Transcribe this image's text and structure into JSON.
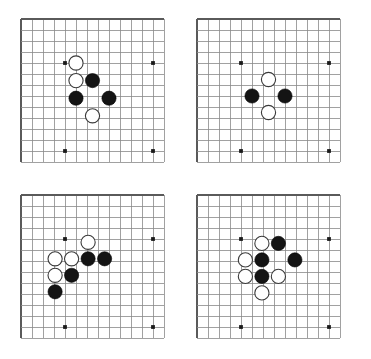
{
  "figure": {
    "type": "go-board-diagram-set",
    "layout": "2x2",
    "panel_count": 4,
    "canvas": {
      "width": 371,
      "height": 359
    }
  },
  "board_geometry": {
    "cell_size": 11,
    "cols": 13,
    "rows": 13,
    "grid_origin_x": 21,
    "grid_origin_y": 19,
    "panel_offset_x": 176,
    "panel_offset_y": 176,
    "stone_radius": 7.1,
    "star_point_radius": 1.9,
    "star_points": [
      [
        4,
        4
      ],
      [
        12,
        4
      ],
      [
        4,
        12
      ],
      [
        12,
        12
      ]
    ],
    "edges": {
      "left": true,
      "top": true,
      "right": false,
      "bottom": false
    }
  },
  "colors": {
    "grid_line": "#8a8a8a",
    "edge_line": "#5a5a5a",
    "black_stone": "#141414",
    "white_stone": "#ffffff",
    "white_stone_outline": "#3a3a3a",
    "star_point": "#1a1a1a",
    "background": "#ffffff"
  },
  "panels": [
    {
      "id": "panel-top-left",
      "position": {
        "x": 0,
        "y": 0
      },
      "stone_count": 5,
      "black_count": 3,
      "white_count": 2,
      "stones": [
        {
          "color": "white",
          "col": 5,
          "row": 4
        },
        {
          "color": "white",
          "col": 5,
          "row": 5.6
        },
        {
          "color": "black",
          "col": 6.5,
          "row": 5.6
        },
        {
          "color": "black",
          "col": 5,
          "row": 7.2
        },
        {
          "color": "black",
          "col": 8,
          "row": 7.2
        },
        {
          "color": "white",
          "col": 6.5,
          "row": 8.8
        }
      ]
    },
    {
      "id": "panel-top-right",
      "position": {
        "x": 176,
        "y": 0
      },
      "stone_count": 4,
      "black_count": 2,
      "white_count": 2,
      "stones": [
        {
          "color": "white",
          "col": 6.5,
          "row": 5.5
        },
        {
          "color": "black",
          "col": 5,
          "row": 7
        },
        {
          "color": "black",
          "col": 8,
          "row": 7
        },
        {
          "color": "white",
          "col": 6.5,
          "row": 8.5
        }
      ]
    },
    {
      "id": "panel-bottom-left",
      "position": {
        "x": 0,
        "y": 176
      },
      "stone_count": 8,
      "black_count": 4,
      "white_count": 4,
      "stones": [
        {
          "color": "white",
          "col": 6.1,
          "row": 4.3
        },
        {
          "color": "white",
          "col": 3.1,
          "row": 5.8
        },
        {
          "color": "white",
          "col": 4.6,
          "row": 5.8
        },
        {
          "color": "black",
          "col": 6.1,
          "row": 5.8
        },
        {
          "color": "black",
          "col": 7.6,
          "row": 5.8
        },
        {
          "color": "white",
          "col": 3.1,
          "row": 7.3
        },
        {
          "color": "black",
          "col": 4.6,
          "row": 7.3
        },
        {
          "color": "black",
          "col": 3.1,
          "row": 8.8
        }
      ]
    },
    {
      "id": "panel-bottom-right",
      "position": {
        "x": 176,
        "y": 176
      },
      "stone_count": 9,
      "black_count": 4,
      "white_count": 5,
      "stones": [
        {
          "color": "white",
          "col": 5.9,
          "row": 4.4
        },
        {
          "color": "black",
          "col": 7.4,
          "row": 4.4
        },
        {
          "color": "white",
          "col": 4.4,
          "row": 5.9
        },
        {
          "color": "black",
          "col": 5.9,
          "row": 5.9
        },
        {
          "color": "black",
          "col": 8.9,
          "row": 5.9
        },
        {
          "color": "white",
          "col": 4.4,
          "row": 7.4
        },
        {
          "color": "black",
          "col": 5.9,
          "row": 7.4
        },
        {
          "color": "white",
          "col": 7.4,
          "row": 7.4
        },
        {
          "color": "white",
          "col": 5.9,
          "row": 8.9
        }
      ]
    }
  ]
}
